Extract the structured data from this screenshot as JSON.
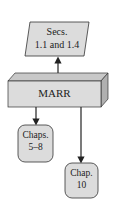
{
  "diagram": {
    "top_node": {
      "line1": "Secs.",
      "line2": "1.1 and 1.4"
    },
    "center_node": {
      "label": "MARR"
    },
    "left_node": {
      "line1": "Chaps.",
      "line2": "5–8"
    },
    "right_node": {
      "line1": "Chap.",
      "line2": "10"
    },
    "colors": {
      "fill": "#dcdcdc",
      "top_face": "#c8c8c8",
      "side_face": "#b4b4b4",
      "stroke": "#333333"
    }
  }
}
